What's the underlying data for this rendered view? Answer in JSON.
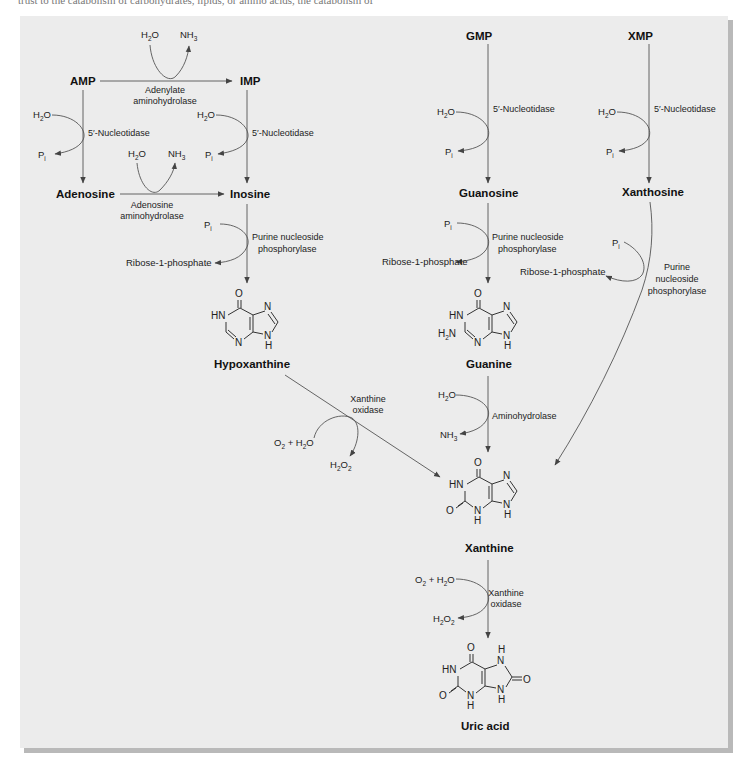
{
  "page": {
    "cut_text": "trust to the catabolism of carbohydrates, lipids, or amino acids, the catabolism of"
  },
  "compounds": {
    "amp": "AMP",
    "imp": "IMP",
    "gmp": "GMP",
    "xmp": "XMP",
    "adenosine": "Adenosine",
    "inosine": "Inosine",
    "guanosine": "Guanosine",
    "xanthosine": "Xanthosine",
    "hypoxanthine": "Hypoxanthine",
    "guanine": "Guanine",
    "xanthine": "Xanthine",
    "uric_acid": "Uric acid"
  },
  "enzymes": {
    "adenylate_aminohydrolase": [
      "Adenylate",
      "aminohydrolase"
    ],
    "adenosine_aminohydrolase": [
      "Adenosine",
      "aminohydrolase"
    ],
    "nucleotidase": "5′-Nucleotidase",
    "pnp": [
      "Purine nucleoside",
      "phosphorylase"
    ],
    "pnp_xanthosine": [
      "Purine",
      "nucleoside",
      "phosphorylase"
    ],
    "aminohydrolase": "Aminohydrolase",
    "xanthine_oxidase": [
      "Xanthine",
      "oxidase"
    ]
  },
  "cosubstrates": {
    "h2o": "H2O",
    "nh3": "NH3",
    "pi": "Pi",
    "ribose1p": "Ribose-1-phosphate",
    "o2_h2o": "O2 + H2O",
    "h2o2": "H2O2"
  },
  "atoms": {
    "o": "O",
    "n": "N",
    "hn": "HN",
    "nh": "NH",
    "h": "H",
    "h2n": "H2N"
  },
  "colors": {
    "panel": "#ececec",
    "shadow": "#b9b9b9",
    "line": "#555555",
    "text": "#111111"
  }
}
